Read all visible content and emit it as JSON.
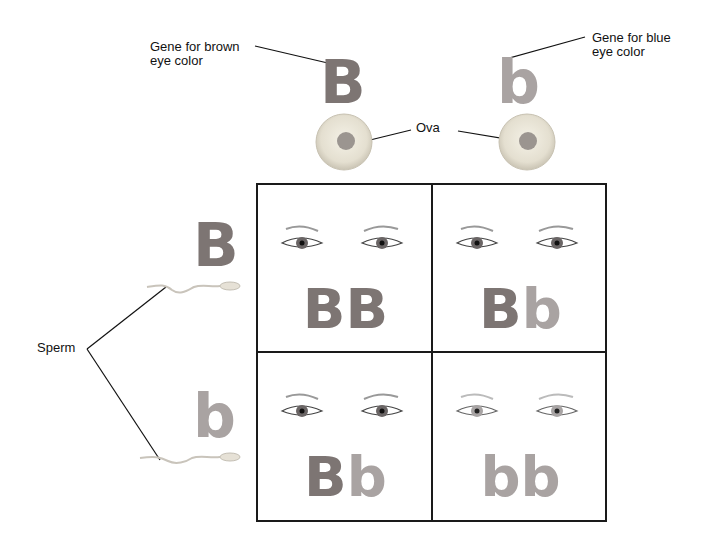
{
  "labels": {
    "gene_brown": "Gene for brown\neye color",
    "gene_blue": "Gene for blue\neye color",
    "ova": "Ova",
    "sperm": "Sperm"
  },
  "alleles": {
    "ovum_left": "B",
    "ovum_right": "b",
    "sperm_top": "B",
    "sperm_bottom": "b"
  },
  "punnett": {
    "cells": [
      {
        "first": "B",
        "second": "B",
        "eyes": "brown"
      },
      {
        "first": "B",
        "second": "b",
        "eyes": "brown"
      },
      {
        "first": "B",
        "second": "b",
        "eyes": "brown"
      },
      {
        "first": "b",
        "second": "b",
        "eyes": "blue"
      }
    ]
  },
  "colors": {
    "dominant_brown": "#7d7573",
    "recessive_blue": "#a9a3a2",
    "grid_line": "#1a1a1a"
  }
}
